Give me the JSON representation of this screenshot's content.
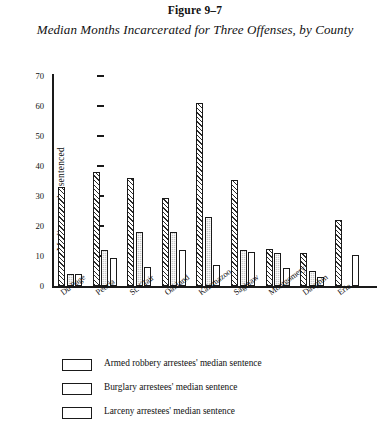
{
  "figure": {
    "number": "Figure 9–7",
    "title": "Median Months Incarcerated for Three Offenses, by County"
  },
  "axes": {
    "ylabel": "Median months sentenced",
    "yticks": [
      "0",
      "10",
      "20",
      "30",
      "40",
      "50",
      "60",
      "70"
    ]
  },
  "legend": {
    "items": [
      {
        "label": "Armed robbery arrestees' median sentence",
        "swatch": "diagonal-hatch",
        "color": "#2b2b2b"
      },
      {
        "label": "Burglary arrestees' median sentence",
        "swatch": "gray-stipple",
        "color": "#c9c9c9"
      },
      {
        "label": "Larceny arrestees' median sentence",
        "swatch": "white-fill",
        "color": "#ffffff"
      }
    ]
  },
  "chart_data": {
    "type": "bar",
    "title": "Median Months Incarcerated for Three Offenses, by County",
    "xlabel": "",
    "ylabel": "Median months sentenced",
    "ylim": [
      0,
      70
    ],
    "ytick_step": 10,
    "grid": false,
    "legend_position": "below",
    "categories": [
      "Du Page",
      "Peoria",
      "St. Clair",
      "Oakland",
      "Kalamazoo",
      "Saginaw",
      "Montgomery",
      "Dauphin",
      "Erie"
    ],
    "series": [
      {
        "name": "Armed robbery arrestees' median sentence",
        "values": [
          33,
          38,
          36,
          29.5,
          61,
          35.5,
          12.5,
          11,
          22
        ]
      },
      {
        "name": "Burglary arrestees' median sentence",
        "values": [
          4,
          12,
          18,
          18,
          23,
          12,
          11,
          5,
          0
        ]
      },
      {
        "name": "Larceny arrestees' median sentence",
        "values": [
          4,
          9.5,
          6.5,
          12,
          7,
          11.5,
          6,
          3,
          10.5
        ]
      }
    ]
  }
}
